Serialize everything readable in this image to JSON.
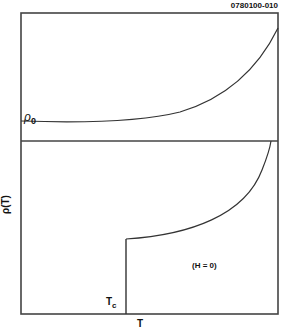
{
  "figure_id": "0780100-010",
  "axes": {
    "y_label": "ρ(T)",
    "x_label": "T"
  },
  "upper_panel": {
    "curve_label": "ρ",
    "curve_label_subscript": "0",
    "description": "Normal-state resistivity rising with temperature from residual value ρ0"
  },
  "lower_panel": {
    "transition_label": "T",
    "transition_label_subscript": "c",
    "condition_label": "(H = 0)",
    "description": "Resistivity drops abruptly to zero at Tc"
  },
  "colors": {
    "line": "#333333",
    "background": "#ffffff"
  }
}
